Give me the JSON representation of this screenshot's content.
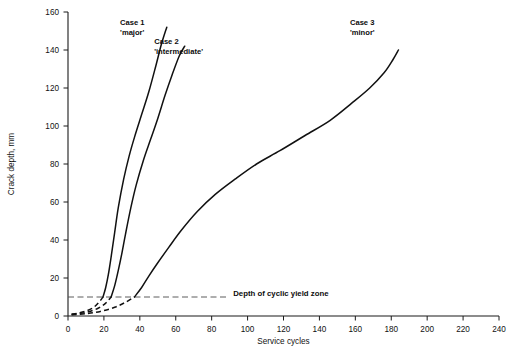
{
  "chart_data": {
    "type": "line",
    "title": "",
    "xlabel": "Service cycles",
    "ylabel": "Crack depth, mm",
    "xlim": [
      0,
      240
    ],
    "ylim": [
      0,
      160
    ],
    "xticks": [
      0,
      20,
      40,
      60,
      80,
      100,
      120,
      140,
      160,
      180,
      200,
      220,
      240
    ],
    "yticks": [
      0,
      20,
      40,
      60,
      80,
      100,
      120,
      140,
      160
    ],
    "grid": false,
    "legend_position": "inline-annotations",
    "series": [
      {
        "name": "Case 1",
        "qualifier": "'major'",
        "label_line1": "Case 1",
        "label_line2": "'major'",
        "label_x": 29,
        "label_y": 153,
        "dashed_segment": {
          "x": [
            2,
            6,
            10,
            14,
            17,
            19.5
          ],
          "y": [
            1.0,
            1.6,
            2.6,
            4.4,
            7.0,
            10.0
          ]
        },
        "x": [
          19.5,
          21,
          22.5,
          24,
          26,
          28,
          31,
          34,
          37,
          41,
          45,
          49,
          52,
          55
        ],
        "y": [
          10,
          15,
          22,
          31,
          44,
          57,
          72,
          84,
          94,
          106,
          118,
          132,
          143,
          152
        ]
      },
      {
        "name": "Case 2",
        "qualifier": "'intermediate'",
        "label_line1": "Case 2",
        "label_line2": "'intermediate'",
        "label_x": 48,
        "label_y": 143,
        "dashed_segment": {
          "x": [
            2,
            7,
            12,
            17,
            21,
            24
          ],
          "y": [
            0.8,
            1.4,
            2.4,
            4.2,
            6.8,
            10.0
          ]
        },
        "x": [
          24,
          26,
          28,
          30,
          32,
          35,
          38,
          42,
          46,
          50,
          54,
          58,
          62,
          65
        ],
        "y": [
          10,
          16,
          24,
          33,
          43,
          57,
          69,
          82,
          93,
          104,
          116,
          127,
          137,
          142
        ]
      },
      {
        "name": "Case 3",
        "qualifier": "'minor'",
        "label_line1": "Case 3",
        "label_line2": "'minor'",
        "label_x": 157,
        "label_y": 153,
        "dashed_segment": {
          "x": [
            2,
            10,
            18,
            26,
            32,
            37
          ],
          "y": [
            0.6,
            1.2,
            2.4,
            4.6,
            7.2,
            10.0
          ]
        },
        "x": [
          37,
          41,
          45,
          50,
          56,
          63,
          72,
          82,
          93,
          105,
          118,
          132,
          146,
          158,
          168,
          176,
          181,
          184
        ],
        "y": [
          10,
          15,
          21,
          28,
          36,
          45,
          55,
          64,
          72,
          80,
          87,
          95,
          103,
          112,
          120,
          128,
          135,
          140
        ]
      }
    ],
    "annotations": [
      {
        "name": "cyclic-yield-zone",
        "text": "Depth of cyclic yield zone",
        "line_y": 10,
        "line_x_start": 0,
        "line_x_end": 88,
        "text_x": 92,
        "text_y": 12
      }
    ]
  }
}
